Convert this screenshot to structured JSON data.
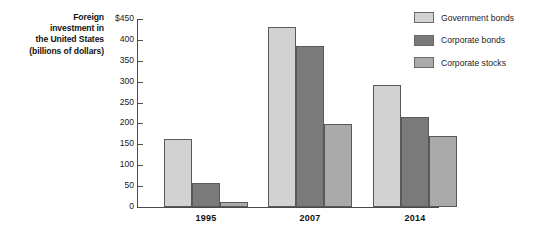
{
  "chart_data": {
    "type": "bar",
    "title": "Foreign investment in the United States (billions of dollars)",
    "title_lines": [
      "Foreign",
      "investment in",
      "the United States",
      "(billions of dollars)"
    ],
    "xlabel": "",
    "ylabel": "Foreign investment in the United States (billions of dollars)",
    "categories": [
      "1995",
      "2007",
      "2014"
    ],
    "ylim": [
      0,
      450
    ],
    "ytick_values": [
      0,
      50,
      100,
      150,
      200,
      250,
      300,
      350,
      400,
      450
    ],
    "ytick_labels": [
      "0",
      "50",
      "100",
      "150",
      "200",
      "250",
      "300",
      "350",
      "400",
      "$450"
    ],
    "grid": false,
    "legend_position": "top-right",
    "series": [
      {
        "name": "Government bonds",
        "color": "#d2d2d2",
        "values": [
          163,
          430,
          293
        ]
      },
      {
        "name": "Corporate bonds",
        "color": "#7a7a7a",
        "values": [
          58,
          385,
          215
        ]
      },
      {
        "name": "Corporate stocks",
        "color": "#aaaaaa",
        "values": [
          13,
          198,
          170
        ]
      }
    ]
  },
  "colors": {
    "government_bonds": "#d2d2d2",
    "corporate_bonds": "#7a7a7a",
    "corporate_stocks": "#aaaaaa",
    "axis": "#4a4a4a",
    "bar_border": "#595959",
    "text": "#1b1b1b",
    "background": "#ffffff"
  }
}
